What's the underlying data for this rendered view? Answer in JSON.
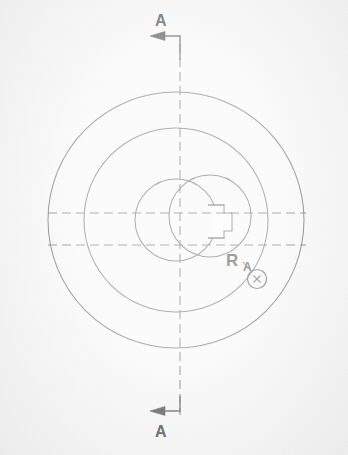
{
  "document": {
    "type": "engineering-drawing",
    "view": "front-circular-view",
    "background_color": "#fafafa",
    "line_color": "#4a4a4a",
    "text_color": "#2b2b2b"
  },
  "annotations": {
    "section_letter_top": "A",
    "section_letter_bottom": "A",
    "dimension_letter_r": "R",
    "dimension_letter_a": "A"
  },
  "cursor": {
    "name": "crosshair-circle-cursor",
    "glyph": "✕",
    "x": 257,
    "y": 279,
    "radius": 9
  },
  "geometry": {
    "center": {
      "x": 176,
      "y": 220
    },
    "circles": [
      {
        "name": "outer-diameter-circle",
        "cx": 176,
        "cy": 220,
        "r": 128
      },
      {
        "name": "middle-diameter-circle",
        "cx": 176,
        "cy": 220,
        "r": 92
      },
      {
        "name": "hub-bore-circle",
        "cx": 176,
        "cy": 220,
        "r": 41
      },
      {
        "name": "offset-boss-circle",
        "cx": 210,
        "cy": 216,
        "r": 41
      }
    ],
    "centerlines": {
      "vertical": {
        "x": 180,
        "y1": 44,
        "y2": 415
      },
      "horizontal_upper": {
        "y": 213,
        "x1": 48,
        "x2": 305
      },
      "horizontal_lower": {
        "y": 245,
        "x1": 48,
        "x2": 305
      }
    },
    "keyway": {
      "name": "keyway-notch",
      "points": "212,205 224,205 224,213 231,213 231,231 224,231 224,238 212,238"
    },
    "section_marks": {
      "top": {
        "corner_x": 180,
        "corner_y": 44,
        "arrow_tip_x": 150,
        "arrow_y": 36,
        "label_x": 160,
        "label_y": 16
      },
      "bottom": {
        "corner_x": 180,
        "corner_y": 415,
        "arrow_tip_x": 150,
        "arrow_y": 410,
        "label_x": 160,
        "label_y": 424
      }
    },
    "leader": {
      "name": "radius-leader-line",
      "path": "M 248 264 L 258 274"
    }
  }
}
